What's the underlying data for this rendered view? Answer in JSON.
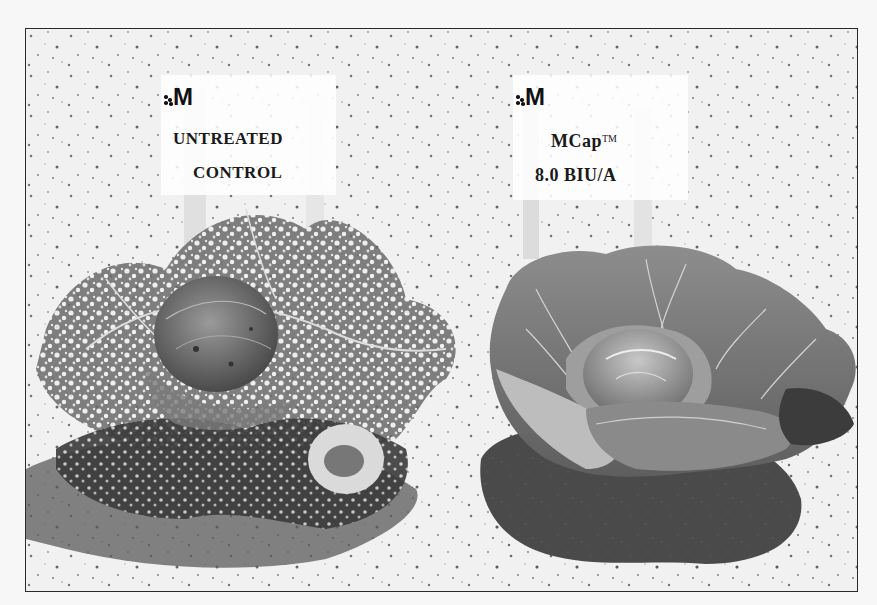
{
  "image": {
    "description": "Black-and-white field trial photo comparing two cabbage plants on sandy soil",
    "background_color": "#f7f7f7",
    "border_color": "#2a2a2a"
  },
  "signs": [
    {
      "logo": "M",
      "line1": "UNTREATED",
      "line2": "CONTROL",
      "trademark": ""
    },
    {
      "logo": "M",
      "line1": "MCap",
      "line1_trademark": "TM",
      "line2": "8.0 BIU/A"
    }
  ],
  "plants": [
    {
      "label": "untreated cabbage",
      "condition": "heavily damaged, skeletonized leaves"
    },
    {
      "label": "treated cabbage",
      "condition": "healthy, intact leaves with dark shadow"
    }
  ]
}
